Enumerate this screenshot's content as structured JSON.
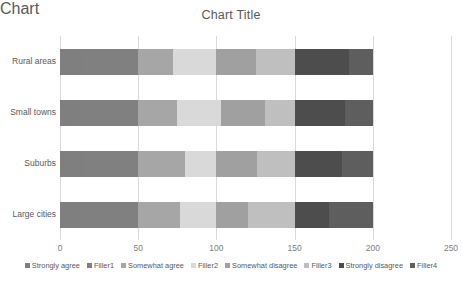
{
  "chart_data": {
    "type": "bar",
    "orientation": "horizontal",
    "stacked": true,
    "title": "Chart Title",
    "xlabel": "",
    "ylabel": "",
    "xlim": [
      0,
      250
    ],
    "xticks": [
      0,
      50,
      100,
      150,
      200,
      250
    ],
    "xtick_labels": [
      "0",
      "50",
      "100",
      "150",
      "200",
      "250"
    ],
    "grid": true,
    "grid_axis": "x",
    "legend_position": "bottom",
    "categories": [
      "Rural areas",
      "Small towns",
      "Suburbs",
      "Large cities"
    ],
    "series": [
      {
        "name": "Strongly agree",
        "color": "#7f7f7f",
        "values": [
          14,
          12,
          16,
          13
        ]
      },
      {
        "name": "Filler1",
        "color": "#808080",
        "values": [
          36,
          38,
          34,
          37
        ]
      },
      {
        "name": "Somewhat agree",
        "color": "#a6a6a6",
        "values": [
          22,
          25,
          30,
          27
        ]
      },
      {
        "name": "Filler2",
        "color": "#d9d9d9",
        "values": [
          28,
          28,
          20,
          23
        ]
      },
      {
        "name": "Somewhat disagree",
        "color": "#a0a0a0",
        "values": [
          25,
          28,
          26,
          20
        ]
      },
      {
        "name": "Filler3",
        "color": "#bfbfbf",
        "values": [
          25,
          19,
          24,
          30
        ]
      },
      {
        "name": "Strongly disagree",
        "color": "#4d4d4d",
        "values": [
          35,
          32,
          30,
          22
        ]
      },
      {
        "name": "Filler4",
        "color": "#5e5e5e",
        "values": [
          15,
          18,
          20,
          28
        ]
      }
    ],
    "category_totals": [
      200,
      200,
      200,
      200
    ]
  }
}
